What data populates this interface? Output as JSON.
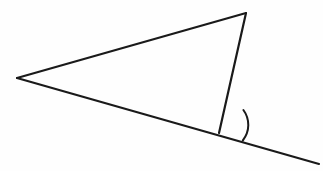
{
  "figure": {
    "canvas": {
      "width": 323,
      "height": 171,
      "background": "#fefefe"
    },
    "style": {
      "stroke_color": "#1a1a1a",
      "stroke_width": 2.2,
      "arc_stroke_width": 2.0,
      "fill": "none"
    },
    "points": {
      "left_vertex": {
        "name": "A",
        "x": 17,
        "y": 78
      },
      "apex_vertex": {
        "name": "B",
        "x": 246,
        "y": 13
      },
      "bottom_vertex": {
        "name": "C",
        "x": 219,
        "y": 133
      },
      "ray_end": {
        "name": "D",
        "x": 319,
        "y": 164
      }
    },
    "segments": [
      {
        "id": "top-edge",
        "label": "A to B",
        "from": "left_vertex",
        "to": "apex_vertex"
      },
      {
        "id": "right-edge",
        "label": "B to C",
        "from": "apex_vertex",
        "to": "bottom_vertex"
      },
      {
        "id": "extended-base",
        "label": "A through C to D",
        "from": "left_vertex",
        "to": "ray_end"
      }
    ],
    "angle_mark": {
      "id": "exterior-angle-arc",
      "label": "exterior angle at C",
      "vertex": "bottom_vertex",
      "radius": 25,
      "start": {
        "x": 243.4,
        "y": 110.0
      },
      "end": {
        "x": 242.8,
        "y": 140.5
      },
      "sweep": 1,
      "large_arc": 0
    },
    "paths": {
      "top_edge": "M 17 78 L 246 13",
      "right_edge": "M 246 13 L 219 133",
      "extended_base": "M 17 78 L 319 164",
      "angle_arc": "M 243.4 110.0 A 25 25 0 0 1 242.8 140.5"
    }
  }
}
